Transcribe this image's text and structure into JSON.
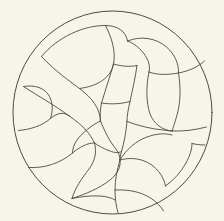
{
  "figure": {
    "kind": "line-drawing",
    "medium": "pen-on-paper",
    "width": 224,
    "height": 221
  },
  "colors": {
    "paper": "#f6f5e9",
    "paper_edge": "#f2f1e3",
    "ink": "#4b4b40",
    "ink_light": "#6a6a5c"
  },
  "stroke": {
    "boundary_width": 1.0,
    "interior_width": 0.9
  },
  "boundary": {
    "name": "outer-circle",
    "cx": 112.5,
    "cy": 112.5,
    "rx": 99.5,
    "ry": 101.5
  },
  "cell_count": 22,
  "curves": [
    {
      "id": "c01",
      "name": "upper-left-lobe-arc",
      "d": "M 41.5 56.5 C 58 36.5, 84 25.5, 105 25.5 C 118 25.5, 126 31.5, 127.5 41"
    },
    {
      "id": "c02",
      "name": "top-left-petal-inner",
      "d": "M 105.5 25.5 C 112 38, 116 52, 113.5 64 C 111 77, 99 86, 79.5 88.5"
    },
    {
      "id": "c03",
      "name": "left-crescent-spine",
      "d": "M 41.5 56.5 C 56 72, 71 82, 79.5 88.5 C 92 98, 100 108, 100.5 121"
    },
    {
      "id": "c04",
      "name": "left-outer-crescent-lower",
      "d": "M 23.5 86.5 C 38 96, 56 106, 70 116.5 C 82 125, 90 133, 94.5 143"
    },
    {
      "id": "c05",
      "name": "left-small-cell-top",
      "d": "M 23.5 86.5 C 35 84.5, 45 88, 49.5 96.5 C 53 103, 53 111, 50.5 118.5"
    },
    {
      "id": "c06",
      "name": "left-small-cell-bottom",
      "d": "M 18.5 130.5 C 30 129.5, 42 126, 50.5 118.5 C 58 112, 65 112, 70 116.5"
    },
    {
      "id": "c07",
      "name": "left-mid-cell-lower",
      "d": "M 28.5 167.5 C 44 168.5, 60 163.5, 72.5 153 C 84 143.5, 91 143, 94.5 143"
    },
    {
      "id": "c08",
      "name": "left-lower-divider",
      "d": "M 94.5 143 C 97 152, 95 161, 89 169 C 82 178, 75 188, 72 198.5"
    },
    {
      "id": "c09",
      "name": "bottom-left-arc",
      "d": "M 72 198.5 C 86 194, 100 188, 110 180 C 118 173.5, 121 166.5, 120 160"
    },
    {
      "id": "c10",
      "name": "center-stem-left",
      "d": "M 100.5 121 C 105 132, 110 142, 116 149 C 119 153, 120 156.5, 120 160"
    },
    {
      "id": "c11",
      "name": "center-stem-right",
      "d": "M 127 121.5 C 126 133, 124 143, 121.5 151.5 C 120.5 155, 120 157.5, 120 160"
    },
    {
      "id": "c12",
      "name": "center-vertical-bar-left",
      "d": "M 113.5 64 C 110.5 75, 106 88, 101.5 103 C 100 110, 100 116, 100.5 121"
    },
    {
      "id": "c13",
      "name": "center-quad-top",
      "d": "M 113.5 64 C 122 66.5, 130 67, 137 65.5"
    },
    {
      "id": "c14",
      "name": "center-quad-bottom",
      "d": "M 101.5 103 C 111 104.5, 121 104, 130 101.5"
    },
    {
      "id": "c15",
      "name": "center-vertical-bar-right",
      "d": "M 137 65.5 C 135.5 76, 133 88, 130 101.5 C 128 110, 127 116, 127 121.5"
    },
    {
      "id": "c16",
      "name": "upper-right-petal",
      "d": "M 127.5 41 C 136 44, 143 51, 147 58.5 C 149.5 63, 150 68, 149 72"
    },
    {
      "id": "c17",
      "name": "upper-right-petal-outer",
      "d": "M 127.5 41 C 141 35.5, 156 38, 166.5 47 C 175 54.5, 179 64, 178.5 73"
    },
    {
      "id": "c18",
      "name": "right-upper-divider",
      "d": "M 149 72 C 157 75, 167 75, 178.5 73 C 189 71, 198 67, 204.5 61"
    },
    {
      "id": "c19",
      "name": "right-big-leaf",
      "d": "M 149 72 C 146 86, 146 102, 150 114 C 154 124, 162 130, 172 131"
    },
    {
      "id": "c20",
      "name": "right-leaf-outer",
      "d": "M 178.5 73 C 181 88, 180.5 103, 177 115 C 174.5 124, 173 128, 172 131"
    },
    {
      "id": "c21",
      "name": "right-horizontal-divider",
      "d": "M 172 131 C 183 131.5, 195 130, 206.5 127"
    },
    {
      "id": "c22",
      "name": "right-mid-divider",
      "d": "M 127 121.5 C 139 126, 152 129, 163 130 C 167 130.5, 170 131, 172 131"
    },
    {
      "id": "c23",
      "name": "lower-right-scallop-1",
      "d": "M 120 160 C 126 149.5, 136 141, 147 137 C 156.5 133.5, 165 133, 172 135"
    },
    {
      "id": "c24",
      "name": "lower-right-scallop-2",
      "d": "M 120 160 C 131 157, 142 158.5, 151 164.5 C 159 170, 164 178, 165.5 186"
    },
    {
      "id": "c25",
      "name": "lower-right-scallop-3",
      "d": "M 165.5 186 C 174 180, 181 172, 186 163 C 190 155.5, 192 149, 192 143.5"
    },
    {
      "id": "c26",
      "name": "bottom-scallop-left",
      "d": "M 120 160 C 117 170, 115 180, 115 190 C 115 198, 116 206, 118 212.5"
    },
    {
      "id": "c27",
      "name": "bottom-scallop-right",
      "d": "M 115 190 C 126 189.5, 137 191, 146 195.5 C 154 199.5, 160 205, 163.5 211"
    },
    {
      "id": "c28",
      "name": "bottom-left-scallop-edge",
      "d": "M 72 198.5 C 81 196.5, 91 195.5, 100 196 C 107 196.5, 112 198, 115 200"
    },
    {
      "id": "c29",
      "name": "right-lower-divider",
      "d": "M 192 143.5 C 196 144.5, 201 145, 205 145"
    },
    {
      "id": "c30",
      "name": "center-fan-left",
      "d": "M 100.5 121 C 92 125, 83 132, 77 140 C 74 144, 72.5 149, 72.5 153"
    },
    {
      "id": "c31",
      "name": "center-fan-bottom-left",
      "d": "M 94.5 143 C 99 146, 104 149, 110 151 C 114 152.5, 118 153.5, 121.5 151.5"
    }
  ]
}
